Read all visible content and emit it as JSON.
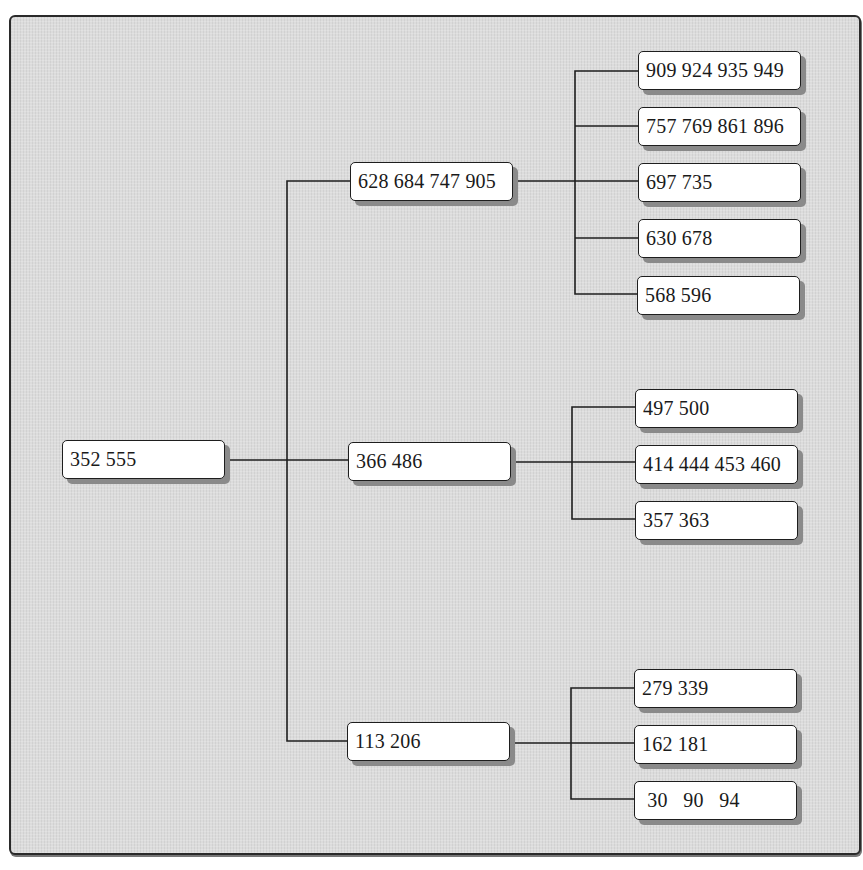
{
  "diagram": {
    "type": "b-tree",
    "root": {
      "label": "352 555"
    },
    "level1": [
      {
        "label": "628 684 747 905"
      },
      {
        "label": "366 486"
      },
      {
        "label": "113 206"
      }
    ],
    "leaves": {
      "top": [
        {
          "label": "909 924 935 949"
        },
        {
          "label": "757 769 861 896"
        },
        {
          "label": "697 735"
        },
        {
          "label": "630 678"
        },
        {
          "label": "568 596"
        }
      ],
      "middle": [
        {
          "label": "497 500"
        },
        {
          "label": "414 444 453 460"
        },
        {
          "label": "357 363"
        }
      ],
      "bottom": [
        {
          "label": "279 339"
        },
        {
          "label": "162 181"
        },
        {
          "label": " 30   90   94"
        }
      ]
    }
  },
  "colors": {
    "background": "#dcdcdc",
    "node_fill": "#ffffff",
    "line": "#1e1e1e",
    "shadow": "#8a8a8a"
  }
}
